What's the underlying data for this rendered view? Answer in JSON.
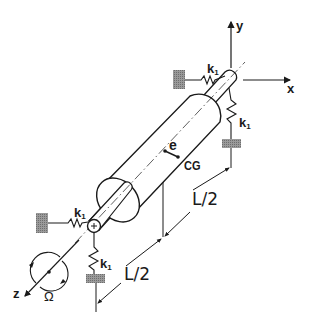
{
  "figure": {
    "colors": {
      "ink": "#1a1a1a",
      "ground": "#8c8c8c",
      "background": "#ffffff"
    }
  },
  "axes": {
    "x_label": "x",
    "y_label": "y",
    "z_label": "z"
  },
  "springs": {
    "right_horizontal": {
      "label": "k",
      "subscript": "1"
    },
    "right_vertical": {
      "label": "k",
      "subscript": "1"
    },
    "left_horizontal": {
      "label": "k",
      "subscript": "1"
    },
    "left_vertical": {
      "label": "k",
      "subscript": "1"
    }
  },
  "rotor": {
    "eccentricity_label": "e",
    "cg_label": "CG",
    "rotation_label": "Ω"
  },
  "dimensions": {
    "upper_half_label": "L/2",
    "lower_half_label": "L/2"
  }
}
